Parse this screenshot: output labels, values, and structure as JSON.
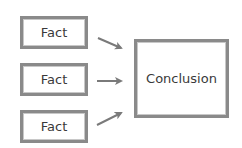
{
  "diagram": {
    "facts": [
      {
        "label": "Fact"
      },
      {
        "label": "Fact"
      },
      {
        "label": "Fact"
      }
    ],
    "conclusion": {
      "label": "Conclusion"
    },
    "arrows": [
      {
        "from": "fact-1",
        "to": "conclusion"
      },
      {
        "from": "fact-2",
        "to": "conclusion"
      },
      {
        "from": "fact-3",
        "to": "conclusion"
      }
    ],
    "colors": {
      "border": "#8a8a8a",
      "arrow": "#7a7a7a",
      "text": "#3a3a3a",
      "background": "#ffffff"
    }
  }
}
